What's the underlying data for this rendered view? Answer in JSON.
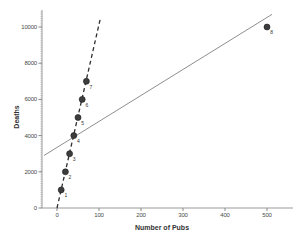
{
  "chart_data": {
    "type": "scatter",
    "title": "",
    "xlabel": "Number of Pubs",
    "ylabel": "Deaths",
    "x_ticks": [
      0,
      100,
      200,
      300,
      400,
      500
    ],
    "y_ticks": [
      0,
      2000,
      4000,
      6000,
      8000,
      10000
    ],
    "xlim": [
      -35,
      560
    ],
    "ylim": [
      0,
      11000
    ],
    "grid": false,
    "legend": "none",
    "points": [
      {
        "label": "1",
        "x": 10,
        "y": 1000
      },
      {
        "label": "2",
        "x": 20,
        "y": 2000
      },
      {
        "label": "3",
        "x": 30,
        "y": 3000
      },
      {
        "label": "4",
        "x": 40,
        "y": 4000
      },
      {
        "label": "5",
        "x": 50,
        "y": 5000
      },
      {
        "label": "6",
        "x": 60,
        "y": 6000
      },
      {
        "label": "7",
        "x": 70,
        "y": 7000
      },
      {
        "label": "8",
        "x": 500,
        "y": 10000
      }
    ],
    "lines": [
      {
        "name": "regression-without-outlier",
        "style": "dashed",
        "color": "#2f2f2f",
        "x1": 0,
        "y1": 0,
        "x2": 104,
        "y2": 10550
      },
      {
        "name": "regression-with-outlier",
        "style": "solid",
        "color": "#8f8f8f",
        "x1": -31,
        "y1": 2900,
        "x2": 512,
        "y2": 10700
      }
    ],
    "point_color": "#3d3d3d",
    "point_edge_color": "#1a1a1a",
    "axis_color": "#9a9a9a",
    "tick_color": "#8a8a8a",
    "minor_tick_color": "#b5b5b5",
    "tick_label_color": "#4a4a4a",
    "point_label_color": "#333333"
  }
}
